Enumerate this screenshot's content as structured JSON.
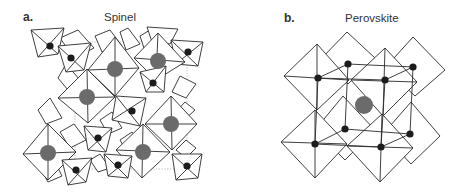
{
  "figure": {
    "panels": [
      {
        "letter": "a.",
        "title": "Spinel",
        "large_atom_color": "#6b6b6b",
        "small_atom_color": "#1c1c1c",
        "large_atoms": [
          [
            115,
            69
          ],
          [
            87,
            97
          ],
          [
            158,
            61
          ],
          [
            171,
            124
          ],
          [
            143,
            152
          ],
          [
            48,
            153
          ]
        ],
        "small_atoms": [
          [
            50,
            46
          ],
          [
            71,
            58
          ],
          [
            188,
            52
          ],
          [
            153,
            83
          ],
          [
            132,
            111
          ],
          [
            98,
            138
          ],
          [
            76,
            170
          ],
          [
            118,
            165
          ],
          [
            187,
            166
          ]
        ]
      },
      {
        "letter": "b.",
        "title": "Perovskite",
        "large_atom_color": "#6b6b6b",
        "small_atom_color": "#1c1c1c",
        "large_atoms": [
          [
            129,
            105
          ]
        ],
        "small_atoms": [
          [
            113,
            64
          ],
          [
            178,
            67
          ],
          [
            83,
            78
          ],
          [
            150,
            80
          ],
          [
            110,
            129
          ],
          [
            175,
            134
          ],
          [
            80,
            144
          ],
          [
            146,
            147
          ]
        ]
      }
    ]
  }
}
